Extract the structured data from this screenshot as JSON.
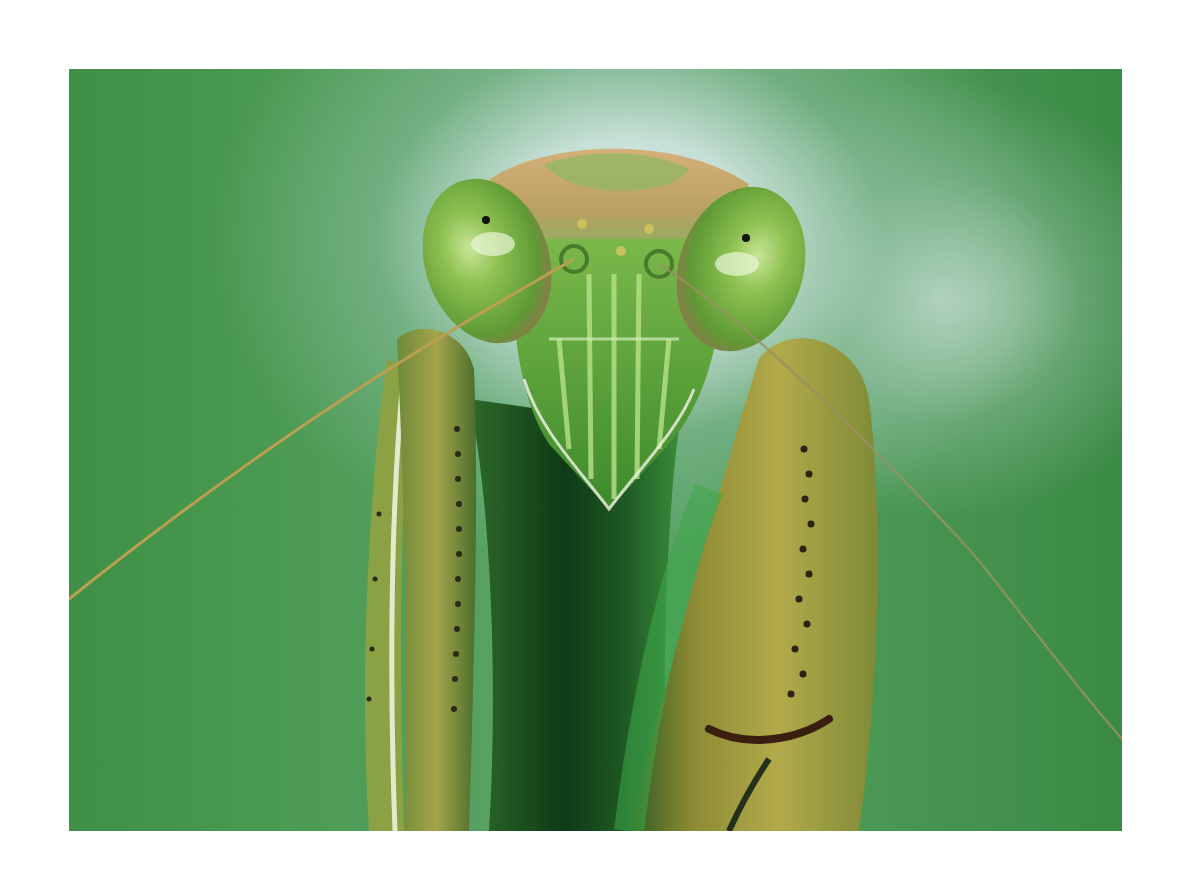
{
  "image": {
    "subject": "Praying mantis head and raptorial forelegs, front view, macro",
    "alt": "Close-up of a green praying mantis facing the camera with large compound eyes, long antennae, and folded spiked forelegs against a blurred green and pale blue background",
    "colors": {
      "background_green": "#4b9a52",
      "background_highlight": "#dfeeea",
      "head_green": "#5fae3a",
      "crown_tan": "#c9a06a",
      "eye_green": "#8cc050",
      "leg_olive": "#9a9a3c",
      "shadow_dark": "#0f3a16"
    }
  }
}
